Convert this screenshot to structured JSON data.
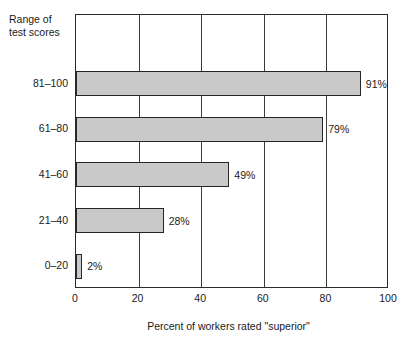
{
  "chart_data": {
    "type": "bar",
    "orientation": "horizontal",
    "title": "",
    "xlabel": "Percent of workers rated \"superior\"",
    "ylabel": "Range of\ntest scores",
    "categories": [
      "81–100",
      "61–80",
      "41–60",
      "21–40",
      "0–20"
    ],
    "values": [
      91,
      79,
      49,
      28,
      2
    ],
    "value_labels": [
      "91%",
      "79%",
      "49%",
      "28%",
      "2%"
    ],
    "xlim": [
      0,
      100
    ],
    "xticks": [
      0,
      20,
      40,
      60,
      80,
      100
    ],
    "xtick_labels": [
      "0",
      "20",
      "40",
      "60",
      "80",
      "100"
    ],
    "grid": "vertical",
    "legend": "none",
    "bar_fill_color": "#c9c9c9",
    "bar_border_color": "#262626",
    "frame_color": "#2b2b2b",
    "background_color": "#ffffff"
  },
  "axis_header": {
    "line1": "Range of",
    "line2": "test scores"
  }
}
